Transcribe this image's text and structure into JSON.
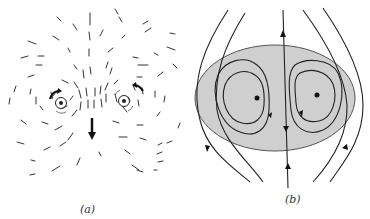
{
  "figure": {
    "panels": [
      {
        "id": "a",
        "label": "(a)",
        "description": "Dashed flow-direction field around two counter-rotating vortex points (vortex pair), with curved arrows indicating rotation and a downward arrow showing induced motion between them"
      },
      {
        "id": "b",
        "label": "(b)",
        "description": "Streamlines in frame moving with the vortex pair: shaded oval region containing two closed recirculation cells with central points, a vertical streamline through the center, and external streamlines flowing around the oval"
      }
    ],
    "colors": {
      "background": "#ffffff",
      "line": "#222222",
      "shaded_region": "#cfcfcf",
      "shaded_border": "#555555"
    }
  }
}
